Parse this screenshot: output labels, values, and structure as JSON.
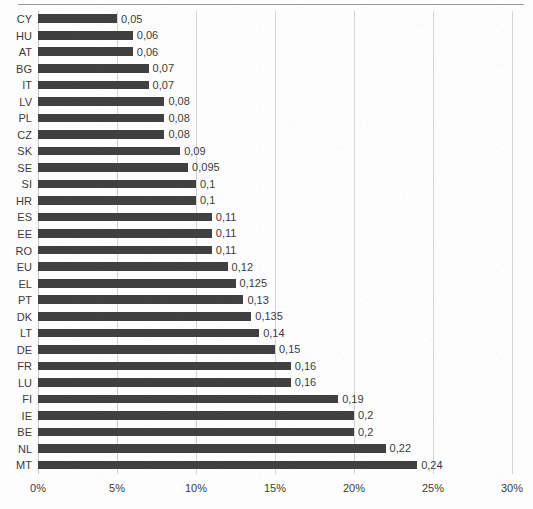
{
  "chart_data": {
    "type": "bar",
    "orientation": "horizontal",
    "title": "",
    "subtitle": "",
    "xlabel": "",
    "ylabel": "",
    "xlim": [
      0,
      30
    ],
    "xtick_labels": [
      "0%",
      "5%",
      "10%",
      "15%",
      "20%",
      "25%",
      "30%"
    ],
    "xtick_values": [
      0,
      5,
      10,
      15,
      20,
      25,
      30
    ],
    "grid": true,
    "legend": false,
    "value_format": "comma-decimal",
    "bar_color": "#404040",
    "gridline_color": "#d4d4d4",
    "text_color": "#3b3b3b",
    "categories": [
      "CY",
      "HU",
      "AT",
      "BG",
      "IT",
      "LV",
      "PL",
      "CZ",
      "SK",
      "SE",
      "SI",
      "HR",
      "ES",
      "EE",
      "RO",
      "EU",
      "EL",
      "PT",
      "DK",
      "LT",
      "DE",
      "FR",
      "LU",
      "FI",
      "IE",
      "BE",
      "NL",
      "MT"
    ],
    "values": [
      0.05,
      0.06,
      0.06,
      0.07,
      0.07,
      0.08,
      0.08,
      0.08,
      0.09,
      0.095,
      0.1,
      0.1,
      0.11,
      0.11,
      0.11,
      0.12,
      0.125,
      0.13,
      0.135,
      0.14,
      0.15,
      0.16,
      0.16,
      0.19,
      0.2,
      0.2,
      0.22,
      0.24
    ],
    "value_labels": [
      "0,05",
      "0,06",
      "0,06",
      "0,07",
      "0,07",
      "0,08",
      "0,08",
      "0,08",
      "0,09",
      "0,095",
      "0,1",
      "0,1",
      "0,11",
      "0,11",
      "0,11",
      "0,12",
      "0,125",
      "0,13",
      "0,135",
      "0,14",
      "0,15",
      "0,16",
      "0,16",
      "0,19",
      "0,2",
      "0,2",
      "0,22",
      "0,24"
    ],
    "series": [
      {
        "name": "",
        "points": [
          {
            "category": "CY",
            "value": 0.05,
            "label": "0,05"
          },
          {
            "category": "HU",
            "value": 0.06,
            "label": "0,06"
          },
          {
            "category": "AT",
            "value": 0.06,
            "label": "0,06"
          },
          {
            "category": "BG",
            "value": 0.07,
            "label": "0,07"
          },
          {
            "category": "IT",
            "value": 0.07,
            "label": "0,07"
          },
          {
            "category": "LV",
            "value": 0.08,
            "label": "0,08"
          },
          {
            "category": "PL",
            "value": 0.08,
            "label": "0,08"
          },
          {
            "category": "CZ",
            "value": 0.08,
            "label": "0,08"
          },
          {
            "category": "SK",
            "value": 0.09,
            "label": "0,09"
          },
          {
            "category": "SE",
            "value": 0.095,
            "label": "0,095"
          },
          {
            "category": "SI",
            "value": 0.1,
            "label": "0,1"
          },
          {
            "category": "HR",
            "value": 0.1,
            "label": "0,1"
          },
          {
            "category": "ES",
            "value": 0.11,
            "label": "0,11"
          },
          {
            "category": "EE",
            "value": 0.11,
            "label": "0,11"
          },
          {
            "category": "RO",
            "value": 0.11,
            "label": "0,11"
          },
          {
            "category": "EU",
            "value": 0.12,
            "label": "0,12"
          },
          {
            "category": "EL",
            "value": 0.125,
            "label": "0,125"
          },
          {
            "category": "PT",
            "value": 0.13,
            "label": "0,13"
          },
          {
            "category": "DK",
            "value": 0.135,
            "label": "0,135"
          },
          {
            "category": "LT",
            "value": 0.14,
            "label": "0,14"
          },
          {
            "category": "DE",
            "value": 0.15,
            "label": "0,15"
          },
          {
            "category": "FR",
            "value": 0.16,
            "label": "0,16"
          },
          {
            "category": "LU",
            "value": 0.16,
            "label": "0,16"
          },
          {
            "category": "FI",
            "value": 0.19,
            "label": "0,19"
          },
          {
            "category": "IE",
            "value": 0.2,
            "label": "0,2"
          },
          {
            "category": "BE",
            "value": 0.2,
            "label": "0,2"
          },
          {
            "category": "NL",
            "value": 0.22,
            "label": "0,22"
          },
          {
            "category": "MT",
            "value": 0.24,
            "label": "0,24"
          }
        ]
      }
    ]
  }
}
